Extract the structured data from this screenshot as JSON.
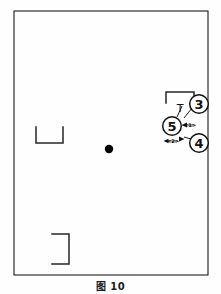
{
  "figure": {
    "caption": "图 10",
    "type": "technical-line-drawing",
    "background_color": "#fefefe",
    "line_color": "#1a1a1a",
    "canvas": {
      "width": 221,
      "height": 294
    }
  },
  "outline": {
    "name": "main-rectangle",
    "x": 14,
    "y": 11,
    "width": 194,
    "height": 264,
    "stroke_width": 1.1
  },
  "center_point": {
    "name": "center-dot",
    "cx": 109,
    "cy": 149,
    "r": 4.2,
    "fill": "#000000"
  },
  "corner_brackets": [
    {
      "name": "bracket-left-u",
      "shape": "u-bracket",
      "points": "36,127 36,143 63,143 63,127",
      "stroke_width": 1.4
    },
    {
      "name": "bracket-bottom-right-square",
      "shape": "right-bracket",
      "points": "52,234 69,234 69,264 52,264",
      "stroke_width": 1.4
    },
    {
      "name": "bracket-top-annotation",
      "shape": "u-bracket-inverted",
      "points": "166,103 166,92 194,92 194,103",
      "stroke_width": 1.4
    }
  ],
  "callouts": [
    {
      "name": "callout-3",
      "label": "3",
      "cx": 199,
      "cy": 104,
      "r": 9.5
    },
    {
      "name": "callout-5",
      "label": "5",
      "cx": 172,
      "cy": 126,
      "r": 9.5
    },
    {
      "name": "callout-4",
      "label": "4",
      "cx": 199,
      "cy": 143,
      "r": 9.5
    }
  ],
  "dimension_labels": [
    {
      "name": "dimension-label-1",
      "text": "<1>",
      "x": 189,
      "y": 125
    },
    {
      "name": "dimension-label-2",
      "text": "<2>",
      "x": 172,
      "y": 142
    }
  ],
  "markers": [
    {
      "name": "t-marker",
      "text": "T",
      "x": 180,
      "y": 108
    }
  ],
  "leader_lines": [
    {
      "name": "leader-3-to-t",
      "d": "M 191,107 L 183,118 L 180,114"
    },
    {
      "name": "leader-5-to-bracket",
      "d": "M 176,117 L 181,107"
    },
    {
      "name": "leader-5-arrow",
      "d": "M 181,125 L 184,125"
    },
    {
      "name": "leader-4-to-dim2",
      "d": "M 190,140 L 183,137"
    }
  ],
  "arrows": [
    {
      "name": "arrow-left-dim1",
      "points": "182,125 187,122.5 187,127.5"
    },
    {
      "name": "arrow-right-dim2",
      "points": "184,139 179,136.5 179,141.5"
    },
    {
      "name": "arrow-left-dim2",
      "points": "164,141 169,138.8 169,143.2"
    }
  ]
}
